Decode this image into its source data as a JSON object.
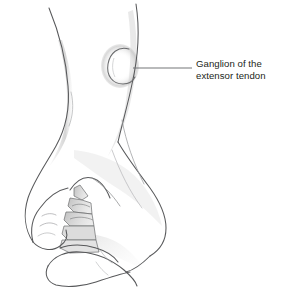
{
  "figure": {
    "kind": "medical-line-illustration",
    "background_color": "#ffffff",
    "ink_color": "#58595b",
    "shade_color": "#d8d8d8",
    "text_color": "#231f20"
  },
  "callout": {
    "label_line_1": "Ganglion of the",
    "label_line_2": "extensor tendon",
    "leader_line": {
      "from_x": 133,
      "from_y": 68,
      "to_x": 192,
      "to_y": 68,
      "color": "#6d6e71"
    }
  },
  "annotations": {
    "ganglion_bump": {
      "name": "ganglion-cyst",
      "center_x": 122,
      "center_y": 65,
      "radius_x": 12,
      "radius_y": 17
    },
    "labels": {
      "thumb": "thumb",
      "flexed_fingers": "flexed-fingers",
      "dorsum": "dorsum-of-hand",
      "forearm": "forearm",
      "wrist": "wrist"
    }
  }
}
